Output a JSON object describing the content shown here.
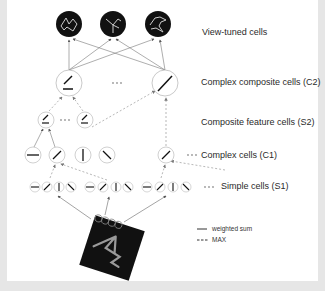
{
  "diagram": {
    "layers": [
      {
        "id": "view_tuned",
        "label": "View-tuned cells"
      },
      {
        "id": "c2",
        "label": "Complex composite cells (C2)"
      },
      {
        "id": "s2",
        "label": "Composite feature cells (S2)"
      },
      {
        "id": "c1",
        "label": "Complex cells (C1)"
      },
      {
        "id": "s1",
        "label": "Simple cells (S1)"
      }
    ],
    "legend": {
      "solid": "weighted sum",
      "dashed": "MAX"
    },
    "ellipsis": "•••",
    "colors": {
      "cell_outline": "#bdbdbd",
      "view_tuned_fill": "#111111",
      "dashed_arrow": "#9a9a9a",
      "solid_arrow": "#666666",
      "background": "#e6e6e6"
    }
  }
}
